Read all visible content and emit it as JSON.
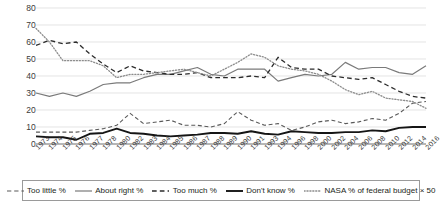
{
  "chart_data": {
    "type": "line",
    "title": "",
    "xlabel": "",
    "ylabel": "",
    "ylim": [
      0,
      80
    ],
    "ytick_step": 10,
    "grid": true,
    "legend_position": "bottom",
    "yticks": [
      "0",
      "10",
      "20",
      "30",
      "40",
      "50",
      "60",
      "70",
      "80"
    ],
    "categories": [
      "1973",
      "1974",
      "1975",
      "1976",
      "1977",
      "1978",
      "1980",
      "1982",
      "1983",
      "1984",
      "1985",
      "1986",
      "1987",
      "1988",
      "1989",
      "1990",
      "1991",
      "1993",
      "1994",
      "1996",
      "1998",
      "2000",
      "2002",
      "2004",
      "2006",
      "2008",
      "2010",
      "2012",
      "2014",
      "2016"
    ],
    "series": [
      {
        "name": "Too little %",
        "style": "dashed",
        "color": "#595959",
        "width": 1.1,
        "values": [
          7,
          7,
          7,
          7,
          8,
          9,
          11,
          18,
          12,
          13,
          14,
          11,
          11,
          10,
          12,
          19,
          14,
          11,
          12,
          8,
          10,
          13,
          14,
          12,
          13,
          15,
          14,
          18,
          24,
          25
        ]
      },
      {
        "name": "About right %",
        "style": "solid",
        "color": "#7a7a7a",
        "width": 1.2,
        "values": [
          30,
          28,
          30,
          28,
          31,
          35,
          36,
          36,
          39,
          41,
          41,
          43,
          45,
          41,
          40,
          44,
          44,
          44,
          37,
          39,
          41,
          40,
          41,
          48,
          44,
          45,
          45,
          42,
          41,
          46
        ]
      },
      {
        "name": "Too much %",
        "style": "dashed",
        "color": "#2b2b2b",
        "width": 1.3,
        "values": [
          58,
          61,
          59,
          60,
          53,
          47,
          42,
          46,
          43,
          42,
          41,
          41,
          42,
          39,
          39,
          39,
          40,
          39,
          51,
          45,
          44,
          44,
          40,
          39,
          38,
          39,
          35,
          31,
          28,
          27
        ]
      },
      {
        "name": "Don't know %",
        "style": "solid",
        "color": "#151515",
        "width": 1.9,
        "values": [
          4.5,
          4,
          4,
          2.5,
          6,
          6.5,
          9,
          6.5,
          6,
          5,
          4.5,
          5,
          5.5,
          6.5,
          6.5,
          6,
          7.5,
          6,
          5.5,
          7.5,
          7,
          6.5,
          6.5,
          7,
          7,
          8,
          7.5,
          9.5,
          10,
          10
        ]
      },
      {
        "name": "NASA % of federal budget × 50",
        "style": "dotted",
        "color": "#8c8c8c",
        "width": 1.3,
        "values": [
          68,
          60,
          49,
          49,
          49,
          46,
          39,
          41,
          41,
          42,
          43,
          44,
          42,
          40,
          44,
          48,
          53,
          51,
          46,
          44,
          43,
          41,
          37,
          32,
          29,
          31,
          27,
          26,
          25,
          21
        ]
      }
    ]
  },
  "legend": {
    "items": [
      {
        "label": "Too little %"
      },
      {
        "label": "About right %"
      },
      {
        "label": "Too much %"
      },
      {
        "label": "Don't know %"
      },
      {
        "label": "NASA % of federal budget × 50"
      }
    ]
  }
}
